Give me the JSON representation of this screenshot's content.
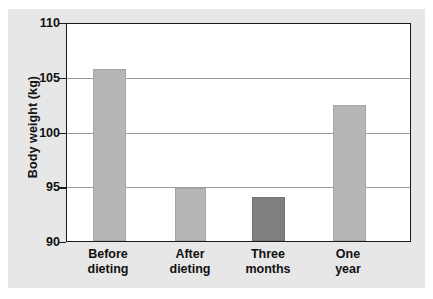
{
  "chart_data": {
    "type": "bar",
    "title": "",
    "xlabel": "",
    "ylabel": "Body weight (kg)",
    "categories": [
      "Before dieting",
      "After dieting",
      "Three months",
      "One year"
    ],
    "category_lines": [
      [
        "Before",
        "dieting"
      ],
      [
        "After",
        "dieting"
      ],
      [
        "Three",
        "months"
      ],
      [
        "One",
        "year"
      ]
    ],
    "values": [
      105.9,
      94.9,
      94.1,
      102.55
    ],
    "ylim": [
      90,
      110
    ],
    "yticks": [
      90,
      95,
      100,
      105,
      110
    ],
    "ytick_labels": [
      "90",
      "95",
      "100",
      "105",
      "110"
    ],
    "grid": true,
    "grid_axis": "y",
    "legend": "none",
    "bar_colors": [
      "#b6b6b6",
      "#b6b6b6",
      "#7f7f7f",
      "#b6b6b6"
    ],
    "bar_border_color": "#9c9c9c"
  },
  "figure": {
    "background_color": "#e7e7e7",
    "plot_background_color": "#ffffff",
    "frame_color": "#1a1a1a",
    "gridline_color": "#9a9a9a"
  }
}
